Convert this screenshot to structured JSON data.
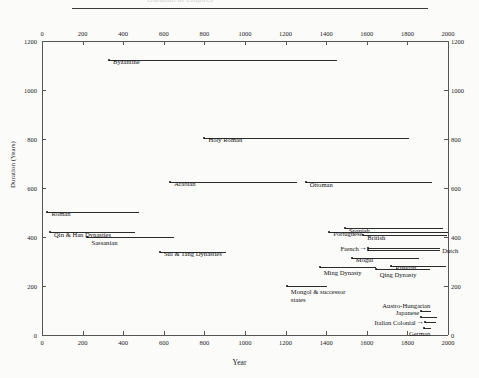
{
  "figure": {
    "top_rule": true,
    "cut_title": "Duration of Empires"
  },
  "chart_data": {
    "type": "bar",
    "orientation": "horizontal-span",
    "title": "",
    "xlabel": "Year",
    "ylabel": "Duration (Years)",
    "xlim": [
      0,
      2000
    ],
    "ylim": [
      0,
      1200
    ],
    "xticks": [
      0,
      200,
      400,
      600,
      800,
      1000,
      1200,
      1400,
      1600,
      1800,
      2000
    ],
    "yticks": [
      0,
      200,
      400,
      600,
      800,
      1000,
      1200
    ],
    "xtick_labels": [
      "0",
      "200",
      "400",
      "600",
      "800",
      "1000",
      "1200",
      "1400",
      "1600",
      "1800",
      "2000"
    ],
    "ytick_labels": [
      "0",
      "200",
      "400",
      "600",
      "800",
      "1000",
      "1200"
    ],
    "top_axis_ticks": true,
    "right_axis_ticks": true,
    "grid": false,
    "legend": "none",
    "note": "Each horizontal segment spans the empire's start year to end year on the x-axis; its vertical position equals its duration in years.",
    "series": [
      {
        "name": "Byzantine",
        "start": 330,
        "end": 1453,
        "duration": 1123,
        "label": "Byzantine",
        "label_pos": "above-left"
      },
      {
        "name": "Holy Roman",
        "start": 800,
        "end": 1806,
        "duration": 806,
        "label": "Holy Roman",
        "label_pos": "above-left"
      },
      {
        "name": "Arabian",
        "start": 632,
        "end": 1258,
        "duration": 626,
        "label": "Arabian",
        "label_pos": "above-left"
      },
      {
        "name": "Ottoman",
        "start": 1299,
        "end": 1922,
        "duration": 623,
        "label": "Ottoman",
        "label_pos": "above-left"
      },
      {
        "name": "Roman",
        "start": 27,
        "end": 476,
        "duration": 503,
        "label": "Roman",
        "label_pos": "above-left"
      },
      {
        "name": "Spanish",
        "start": 1492,
        "end": 1975,
        "duration": 436,
        "label": "Spanish",
        "label_pos": "above-left"
      },
      {
        "name": "Portuguese",
        "start": 1415,
        "end": 1999,
        "duration": 422,
        "label": "Portuguese",
        "label_pos": "above-left"
      },
      {
        "name": "Qin & Han Dynasties",
        "start": 40,
        "end": 460,
        "duration": 420,
        "label": "Qin & Han Dynasties",
        "label_pos": "above-left"
      },
      {
        "name": "British",
        "start": 1583,
        "end": 1997,
        "duration": 407,
        "label": "British",
        "label_pos": "above-left"
      },
      {
        "name": "Sassanian",
        "start": 224,
        "end": 651,
        "duration": 398,
        "label": "Sassanian",
        "label_pos": "below-left"
      },
      {
        "name": "French",
        "start": 1605,
        "end": 1962,
        "duration": 357,
        "label": "French",
        "label_pos": "left-arrow"
      },
      {
        "name": "Dutch",
        "start": 1605,
        "end": 1962,
        "duration": 345,
        "label": "Dutch",
        "label_pos": "right-end"
      },
      {
        "name": "Sui & Tang Dynasties",
        "start": 581,
        "end": 907,
        "duration": 340,
        "label": "Sui & Tang Dynasties",
        "label_pos": "above-left"
      },
      {
        "name": "Mogul",
        "start": 1526,
        "end": 1857,
        "duration": 315,
        "label": "Mogul",
        "label_pos": "above-left"
      },
      {
        "name": "Russian",
        "start": 1721,
        "end": 1991,
        "duration": 283,
        "label": "Russian",
        "label_pos": "above-left"
      },
      {
        "name": "Ming Dynasty",
        "start": 1368,
        "end": 1644,
        "duration": 276,
        "label": "Ming Dynasty",
        "label_pos": "below-left"
      },
      {
        "name": "Qing Dynasty",
        "start": 1644,
        "end": 1912,
        "duration": 268,
        "label": "Qing Dynasty",
        "label_pos": "below-left"
      },
      {
        "name": "Mongol & successor states",
        "start": 1206,
        "end": 1405,
        "duration": 199,
        "label": "Mongol & successor states",
        "label_pos": "below-left"
      },
      {
        "name": "Austro-Hungarian",
        "start": 1867,
        "end": 1918,
        "duration": 99,
        "label": "Austro-Hungarian",
        "label_pos": "above-right"
      },
      {
        "name": "Japanese",
        "start": 1868,
        "end": 1947,
        "duration": 73,
        "label": "Japanese",
        "label_pos": "left-of-line"
      },
      {
        "name": "Italian Colonial",
        "start": 1885,
        "end": 1943,
        "duration": 52,
        "label": "Italian Colonial",
        "label_pos": "left-arrow"
      },
      {
        "name": "German",
        "start": 1884,
        "end": 1918,
        "duration": 28,
        "label": "German",
        "label_pos": "below-right"
      }
    ]
  }
}
